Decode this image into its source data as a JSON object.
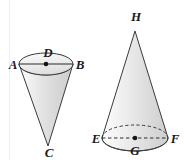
{
  "figure": {
    "background_color": "#ffffff",
    "outline_color": "#3a3a3a",
    "fill_light": "#fbfbfb",
    "fill_mid": "#e6e6e6",
    "fill_dark": "#d2d2d2",
    "label_color": "#1a1a1a",
    "shapes": [
      {
        "name": "inverted-cone",
        "type": "cone",
        "orientation": "apex-down",
        "apex_label": "C",
        "center_label": "D",
        "diameter_endpoints": [
          "A",
          "B"
        ],
        "base_edge_style": "solid",
        "diameter_style": "solid"
      },
      {
        "name": "upright-cone",
        "type": "cone",
        "orientation": "apex-up",
        "apex_label": "H",
        "center_label": "G",
        "diameter_endpoints": [
          "E",
          "F"
        ],
        "base_edge_style": "dashed-back-solid-front",
        "diameter_style": "dashed"
      }
    ],
    "labels": {
      "left_cone": {
        "A": "A",
        "B": "B",
        "C": "C",
        "D": "D"
      },
      "right_cone": {
        "E": "E",
        "F": "F",
        "G": "G",
        "H": "H"
      }
    }
  }
}
